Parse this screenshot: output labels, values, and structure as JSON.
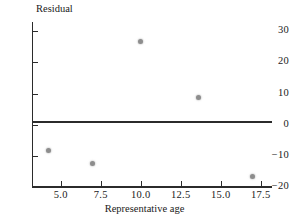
{
  "chart_data": {
    "type": "scatter",
    "title": "",
    "xlabel": "Representative age",
    "ylabel": "Residual",
    "xlim": [
      3.2,
      18.2
    ],
    "ylim": [
      -20,
      33
    ],
    "xticks": [
      "5.0",
      "7.5",
      "10.0",
      "12.5",
      "15.0",
      "17.5"
    ],
    "xtick_values": [
      5.0,
      7.5,
      10.0,
      12.5,
      15.0,
      17.5
    ],
    "yticks": [
      "30",
      "20",
      "10",
      "0",
      "−10",
      "−20"
    ],
    "ytick_values": [
      30,
      20,
      10,
      0,
      -10,
      -20
    ],
    "grid": false,
    "legend": "none",
    "reference_line": {
      "y": 0,
      "style": "solid",
      "color": "#2b2b2b"
    },
    "marker_color": "#8d8d8d",
    "axis_color": "#2b2b2b",
    "points": [
      {
        "x": 4.2,
        "y": -8.4
      },
      {
        "x": 7.0,
        "y": -12.4
      },
      {
        "x": 10.0,
        "y": 26.7
      },
      {
        "x": 13.6,
        "y": 8.7
      },
      {
        "x": 17.0,
        "y": -16.7
      }
    ]
  }
}
